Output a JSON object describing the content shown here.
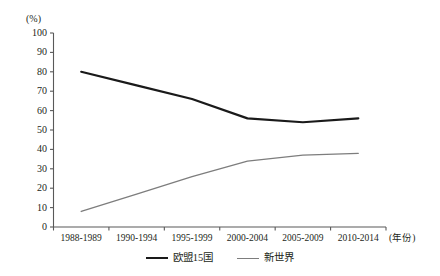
{
  "chart_data": {
    "type": "line",
    "title": "",
    "subtitle": "",
    "xlabel": "(年份)",
    "ylabel": "(%)",
    "ylim": [
      0,
      100
    ],
    "ytick_step": 10,
    "grid": false,
    "legend_position": "bottom",
    "categories": [
      "1988-1989",
      "1990-1994",
      "1995-1999",
      "2000-2004",
      "2005-2009",
      "2010-2014"
    ],
    "ytick_labels": [
      "0",
      "10",
      "20",
      "30",
      "40",
      "50",
      "60",
      "70",
      "80",
      "90",
      "100"
    ],
    "series": [
      {
        "name": "欧盟15国",
        "color": "#1a1a1a",
        "width": 2.2,
        "values": [
          80,
          73,
          66,
          56,
          54,
          56
        ]
      },
      {
        "name": "新世界",
        "color": "#7d7d7d",
        "width": 1.3,
        "values": [
          8,
          17,
          26,
          34,
          37,
          38
        ]
      }
    ]
  },
  "axis": {
    "unit_label": "(%)",
    "x_axis_title": "(年份)"
  },
  "legend": {
    "items": [
      {
        "label": "欧盟15国"
      },
      {
        "label": "新世界"
      }
    ]
  }
}
